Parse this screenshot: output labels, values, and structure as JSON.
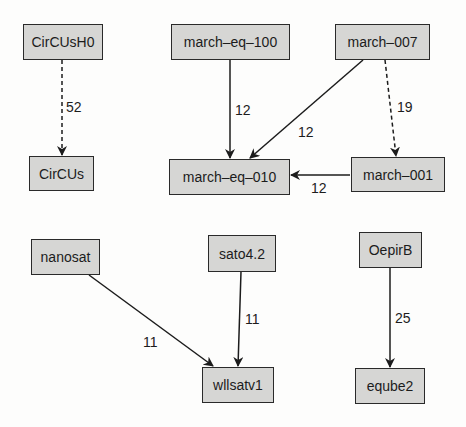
{
  "diagram": {
    "type": "directed-graph",
    "nodes": [
      {
        "id": "CirCUsH0",
        "label": "CirCUsH0",
        "x": 23,
        "y": 24,
        "w": 80,
        "h": 36
      },
      {
        "id": "CirCUs",
        "label": "CirCUs",
        "x": 29,
        "y": 156,
        "w": 65,
        "h": 35
      },
      {
        "id": "march-eq-100",
        "label": "march–eq–100",
        "x": 171,
        "y": 24,
        "w": 119,
        "h": 36
      },
      {
        "id": "march-007",
        "label": "march–007",
        "x": 335,
        "y": 24,
        "w": 95,
        "h": 36
      },
      {
        "id": "march-eq-010",
        "label": "march–eq–010",
        "x": 169,
        "y": 159,
        "w": 121,
        "h": 36
      },
      {
        "id": "march-001",
        "label": "march–001",
        "x": 351,
        "y": 157,
        "w": 94,
        "h": 35
      },
      {
        "id": "nanosat",
        "label": "nanosat",
        "x": 31,
        "y": 239,
        "w": 69,
        "h": 36
      },
      {
        "id": "sato4.2",
        "label": "sato4.2",
        "x": 208,
        "y": 235,
        "w": 68,
        "h": 37
      },
      {
        "id": "wllsatv1",
        "label": "wllsatv1",
        "x": 202,
        "y": 367,
        "w": 72,
        "h": 36
      },
      {
        "id": "OepirB",
        "label": "OepirB",
        "x": 359,
        "y": 232,
        "w": 63,
        "h": 36
      },
      {
        "id": "eqube2",
        "label": "eqube2",
        "x": 355,
        "y": 368,
        "w": 70,
        "h": 36
      }
    ],
    "edges": [
      {
        "from": "CirCUsH0",
        "to": "CirCUs",
        "label": "52",
        "style": "dashed",
        "x1": 62,
        "y1": 60,
        "x2": 62,
        "y2": 155,
        "lx": 66,
        "ly": 100
      },
      {
        "from": "march-eq-100",
        "to": "march-eq-010",
        "label": "12",
        "style": "solid",
        "x1": 230,
        "y1": 60,
        "x2": 230,
        "y2": 158,
        "lx": 235,
        "ly": 103
      },
      {
        "from": "march-007",
        "to": "march-eq-010",
        "label": "12",
        "style": "solid",
        "x1": 363,
        "y1": 60,
        "x2": 250,
        "y2": 158,
        "lx": 298,
        "ly": 125
      },
      {
        "from": "march-007",
        "to": "march-001",
        "label": "19",
        "style": "dashed",
        "x1": 385,
        "y1": 60,
        "x2": 396,
        "y2": 156,
        "lx": 397,
        "ly": 100
      },
      {
        "from": "march-001",
        "to": "march-eq-010",
        "label": "12",
        "style": "solid",
        "x1": 350,
        "y1": 175,
        "x2": 291,
        "y2": 175,
        "lx": 311,
        "ly": 181
      },
      {
        "from": "nanosat",
        "to": "wllsatv1",
        "label": "11",
        "style": "solid",
        "x1": 89,
        "y1": 275,
        "x2": 213,
        "y2": 366,
        "lx": 143,
        "ly": 335
      },
      {
        "from": "sato4.2",
        "to": "wllsatv1",
        "label": "11",
        "style": "solid",
        "x1": 241,
        "y1": 272,
        "x2": 238,
        "y2": 366,
        "lx": 245,
        "ly": 312
      },
      {
        "from": "OepirB",
        "to": "eqube2",
        "label": "25",
        "style": "solid",
        "x1": 390,
        "y1": 268,
        "x2": 390,
        "y2": 367,
        "lx": 395,
        "ly": 311
      }
    ]
  },
  "colors": {
    "node_fill": "#d6d6d4",
    "node_border": "#2a2a2a",
    "edge": "#1c1c1c",
    "background": "#fdfdfc"
  }
}
